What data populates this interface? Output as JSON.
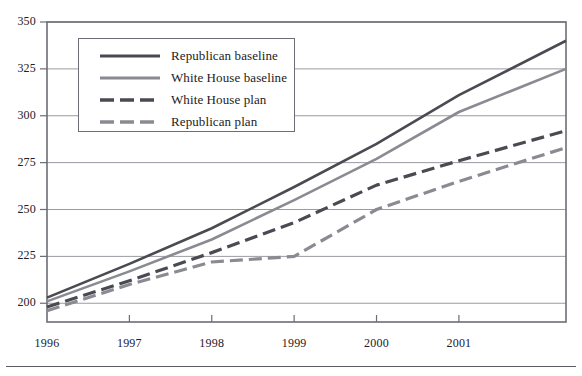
{
  "chart_data": {
    "type": "line",
    "title": "",
    "xlabel": "",
    "ylabel": "",
    "xlim": [
      1996,
      2002.3
    ],
    "ylim": [
      190,
      350
    ],
    "yticks": [
      200,
      225,
      250,
      275,
      300,
      325,
      350
    ],
    "ytick_labels": [
      "200",
      "225",
      "250",
      "275",
      "300",
      "325",
      "350"
    ],
    "xticks": [
      1996,
      1997,
      1998,
      1999,
      2000,
      2001
    ],
    "xtick_labels": [
      "1996",
      "1997",
      "1998",
      "1999",
      "2000",
      "2001"
    ],
    "grid": true,
    "grid_axis": "y",
    "legend_position": "upper-left-inside",
    "series": [
      {
        "name": "Republican baseline",
        "style": "solid",
        "color": "#4a4a52",
        "x": [
          1996,
          1997,
          1998,
          1999,
          2000,
          2001,
          2002.3
        ],
        "values": [
          203,
          221,
          240,
          262,
          285,
          311,
          340
        ]
      },
      {
        "name": "White House baseline",
        "style": "solid",
        "color": "#8a8a92",
        "x": [
          1996,
          1997,
          1998,
          1999,
          2000,
          2001,
          2002.3
        ],
        "values": [
          201,
          217,
          234,
          255,
          277,
          302,
          325
        ]
      },
      {
        "name": "White House plan",
        "style": "dashed",
        "color": "#4a4a52",
        "x": [
          1996,
          1997,
          1998,
          1999,
          2000,
          2001,
          2002.3
        ],
        "values": [
          198,
          212,
          227,
          243,
          263,
          276,
          292
        ]
      },
      {
        "name": "Republican plan",
        "style": "dashed",
        "color": "#8a8a92",
        "x": [
          1996,
          1997,
          1998,
          1999,
          2000,
          2001,
          2002.3
        ],
        "values": [
          196,
          210,
          222,
          225,
          250,
          265,
          283
        ]
      }
    ]
  },
  "legend": {
    "items": [
      {
        "label": "Republican baseline"
      },
      {
        "label": "White House baseline"
      },
      {
        "label": "White House plan"
      },
      {
        "label": "Republican plan"
      }
    ]
  },
  "axes": {
    "y_labels": [
      "350",
      "325",
      "300",
      "275",
      "250",
      "225",
      "200"
    ],
    "x_labels": [
      "1996",
      "1997",
      "1998",
      "1999",
      "2000",
      "2001"
    ]
  }
}
